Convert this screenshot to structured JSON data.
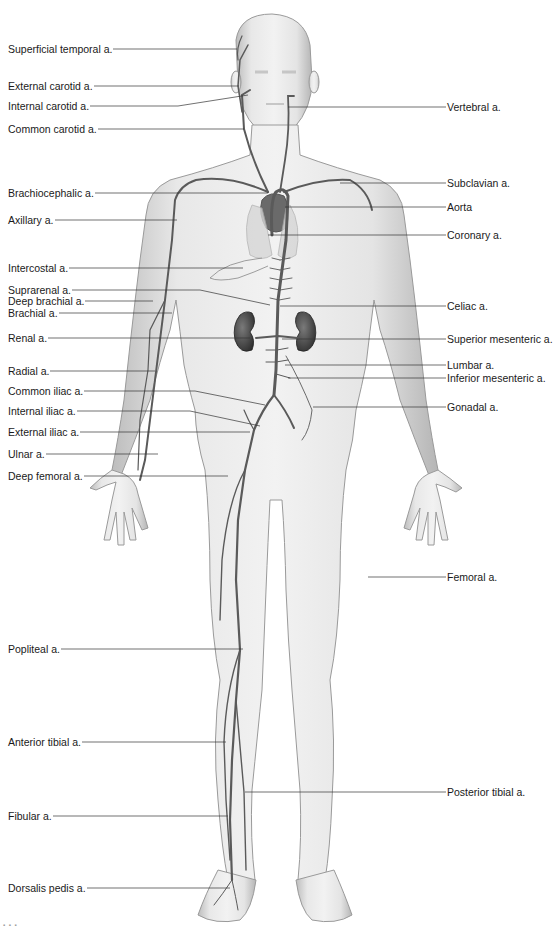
{
  "figure": {
    "colors": {
      "skin": "#e6e6e6",
      "skin_shadow": "#b9b9b9",
      "artery": "#5a5a5a",
      "organ": "#4a4a4a",
      "leader": "#333333"
    },
    "credit": "▪ ▪ ▪"
  },
  "labels_left": [
    {
      "text": "Superficial temporal a.",
      "y": 49,
      "tx": 237,
      "ty": 49
    },
    {
      "text": "External carotid a.",
      "y": 86,
      "tx": 239,
      "ty": 86
    },
    {
      "text": "Internal carotid a.",
      "y": 106,
      "tx": 248,
      "ty": 95
    },
    {
      "text": "Common carotid a.",
      "y": 129,
      "tx": 244,
      "ty": 129
    },
    {
      "text": "Brachiocephalic a.",
      "y": 193,
      "tx": 268,
      "ty": 193
    },
    {
      "text": "Axillary a.",
      "y": 220,
      "tx": 177,
      "ty": 220
    },
    {
      "text": "Intercostal a.",
      "y": 268,
      "tx": 243,
      "ty": 268
    },
    {
      "text": "Suprarenal a.",
      "y": 290,
      "tx": 270,
      "ty": 305
    },
    {
      "text": "Deep brachial a.",
      "y": 301,
      "tx": 153,
      "ty": 301
    },
    {
      "text": "Brachial a.",
      "y": 313,
      "tx": 172,
      "ty": 313
    },
    {
      "text": "Renal a.",
      "y": 338,
      "tx": 250,
      "ty": 338
    },
    {
      "text": "Radial a.",
      "y": 371,
      "tx": 155,
      "ty": 371
    },
    {
      "text": "Common iliac a.",
      "y": 391,
      "tx": 265,
      "ty": 405
    },
    {
      "text": "Internal iliac a.",
      "y": 411,
      "tx": 260,
      "ty": 426
    },
    {
      "text": "External iliac a.",
      "y": 432,
      "tx": 250,
      "ty": 432
    },
    {
      "text": "Ulnar a.",
      "y": 454,
      "tx": 158,
      "ty": 454
    },
    {
      "text": "Deep femoral a.",
      "y": 476,
      "tx": 228,
      "ty": 476
    },
    {
      "text": "Popliteal a.",
      "y": 649,
      "tx": 243,
      "ty": 649
    },
    {
      "text": "Anterior tibial a.",
      "y": 742,
      "tx": 226,
      "ty": 742
    },
    {
      "text": "Fibular a.",
      "y": 816,
      "tx": 228,
      "ty": 816
    },
    {
      "text": "Dorsalis pedis a.",
      "y": 888,
      "tx": 230,
      "ty": 888
    }
  ],
  "labels_right": [
    {
      "text": "Vertebral a.",
      "y": 107,
      "tx": 288,
      "ty": 107
    },
    {
      "text": "Subclavian a.",
      "y": 183,
      "tx": 340,
      "ty": 183
    },
    {
      "text": "Aorta",
      "y": 207,
      "tx": 285,
      "ty": 207
    },
    {
      "text": "Coronary a.",
      "y": 235,
      "tx": 268,
      "ty": 235
    },
    {
      "text": "Celiac a.",
      "y": 306,
      "tx": 280,
      "ty": 306
    },
    {
      "text": "Superior mesenteric a.",
      "y": 339,
      "tx": 282,
      "ty": 339
    },
    {
      "text": "Lumbar a.",
      "y": 365,
      "tx": 285,
      "ty": 365
    },
    {
      "text": "Inferior mesenteric a.",
      "y": 378,
      "tx": 288,
      "ty": 378
    },
    {
      "text": "Gonadal a.",
      "y": 407,
      "tx": 313,
      "ty": 407
    },
    {
      "text": "Femoral a.",
      "y": 577,
      "tx": 368,
      "ty": 577
    },
    {
      "text": "Posterior tibial a.",
      "y": 792,
      "tx": 245,
      "ty": 792
    }
  ]
}
